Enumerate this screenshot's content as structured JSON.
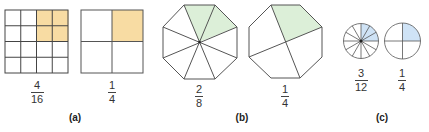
{
  "colors": {
    "stroke": "#444444",
    "orange_fill": "#f8dca3",
    "green_fill": "#dcefd8",
    "blue_fill": "#cfe3f6"
  },
  "panels": [
    {
      "label": "(a)",
      "shape": "square",
      "figures": [
        {
          "grid": "4x4",
          "shaded_cells": 4,
          "total_cells": 16,
          "fraction": {
            "numerator": "4",
            "denominator": "16"
          }
        },
        {
          "grid": "2x2",
          "shaded_cells": 1,
          "total_cells": 4,
          "fraction": {
            "numerator": "1",
            "denominator": "4"
          }
        }
      ]
    },
    {
      "label": "(b)",
      "shape": "octagon",
      "figures": [
        {
          "slices": 8,
          "shaded_slices": 2,
          "fraction": {
            "numerator": "2",
            "denominator": "8"
          }
        },
        {
          "slices": 4,
          "shaded_slices": 1,
          "fraction": {
            "numerator": "1",
            "denominator": "4"
          }
        }
      ]
    },
    {
      "label": "(c)",
      "shape": "circle",
      "figures": [
        {
          "slices": 12,
          "shaded_slices": 3,
          "fraction": {
            "numerator": "3",
            "denominator": "12"
          }
        },
        {
          "slices": 4,
          "shaded_slices": 1,
          "fraction": {
            "numerator": "1",
            "denominator": "4"
          }
        }
      ]
    }
  ]
}
